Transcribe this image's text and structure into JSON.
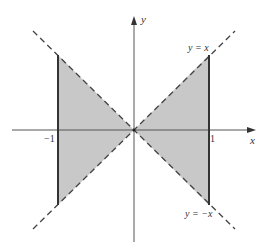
{
  "figure": {
    "colors": {
      "shade": "#c8c8c8",
      "axis": "#555555",
      "boundary": "#333333",
      "background": "#ffffff"
    },
    "axes": {
      "x_label": "x",
      "y_label": "y",
      "ticks": [
        {
          "value": -1,
          "label": "−1"
        },
        {
          "value": 1,
          "label": "1"
        }
      ]
    },
    "lines": [
      {
        "label": "y = x",
        "style": "dashed"
      },
      {
        "label": "y = −x",
        "style": "dashed"
      }
    ],
    "boundaries": [
      {
        "x": -1,
        "style": "solid-thick"
      },
      {
        "x": 1,
        "style": "solid-thick"
      }
    ],
    "region": {
      "shading": "gray",
      "shape": "two triangles meeting at origin"
    }
  }
}
